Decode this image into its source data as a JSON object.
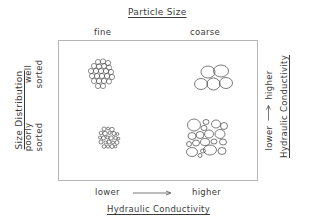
{
  "diagram": {
    "top_axis": {
      "title": "Particle Size",
      "columns": [
        "fine",
        "coarse"
      ]
    },
    "left_axis": {
      "title": "Size Distribution",
      "rows": [
        {
          "line1": "well",
          "line2": "sorted"
        },
        {
          "line1": "poorly",
          "line2": "sorted"
        }
      ]
    },
    "bottom_axis": {
      "low": "lower",
      "high": "higher",
      "title": "Hydraulic Conductivity"
    },
    "right_axis": {
      "low": "lower",
      "high": "higher",
      "title": "Hydraulic Conductivity"
    },
    "cells": [
      {
        "id": "fine-well-sorted",
        "icon": "fine-grain-cluster-icon"
      },
      {
        "id": "coarse-well-sorted",
        "icon": "coarse-grain-cluster-icon"
      },
      {
        "id": "fine-poorly-sorted",
        "icon": "mixed-fine-grain-cluster-icon"
      },
      {
        "id": "coarse-poorly-sorted",
        "icon": "mixed-coarse-grain-cluster-icon"
      }
    ]
  }
}
